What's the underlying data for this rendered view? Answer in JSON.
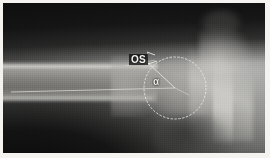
{
  "image": {
    "kind": "radiograph",
    "modality_label": "X-ray",
    "view": "hip joint lateral",
    "frame_color": "#f4f3f0",
    "film_dark": "#141414",
    "film_light": "#bcbcba"
  },
  "annotations": {
    "offset_label": "OS",
    "angle_label": "α",
    "circle": {
      "center_x": 172,
      "center_y": 85,
      "diameter": 62,
      "stroke_color": "#e8e8e2"
    },
    "baseline": {
      "from_x": 8,
      "from_y": 88,
      "to_x": 172,
      "to_y": 85,
      "stroke_color": "#dedeD8"
    },
    "radius_line": {
      "from_x": 172,
      "from_y": 85,
      "to_x": 146,
      "to_y": 60,
      "stroke_color": "#e4e4de"
    },
    "offset_ticks": {
      "count": 2,
      "stroke_color": "#ededE6"
    }
  },
  "anatomy": {
    "parts": [
      "femoral shaft",
      "femoral neck",
      "femoral head",
      "acetabulum",
      "pelvis"
    ]
  }
}
